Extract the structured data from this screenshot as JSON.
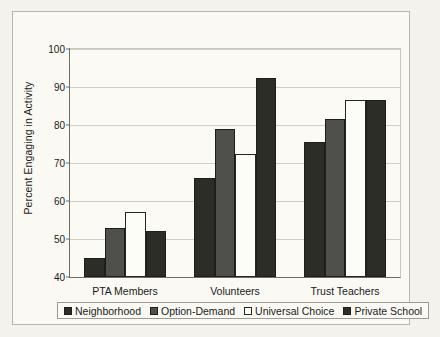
{
  "chart_data": {
    "type": "bar",
    "title": "",
    "xlabel": "",
    "ylabel": "Percent Engaging in Activity",
    "ylim": [
      40,
      100
    ],
    "yticks": [
      40,
      50,
      60,
      70,
      80,
      90,
      100
    ],
    "grid": true,
    "legend_position": "bottom",
    "categories": [
      "PTA Members",
      "Volunteers",
      "Trust Teachers"
    ],
    "series": [
      {
        "name": "Neighborhood",
        "color": "#2d2d28",
        "values": [
          45,
          66,
          75.5
        ]
      },
      {
        "name": "Option-Demand",
        "color": "#4f4f4b",
        "values": [
          53,
          79,
          81.5
        ]
      },
      {
        "name": "Universal Choice",
        "color": "#fdfdf8",
        "values": [
          57,
          72.5,
          86.5
        ]
      },
      {
        "name": "Private School",
        "color": "#2d2d28",
        "values": [
          52,
          92.5,
          86.5
        ]
      }
    ]
  },
  "legend": {
    "items": [
      {
        "label": "Neighborhood",
        "swatch": "dark"
      },
      {
        "label": "Option-Demand",
        "swatch": "gray"
      },
      {
        "label": "Universal Choice",
        "swatch": "white"
      },
      {
        "label": "Private School",
        "swatch": "dark"
      }
    ]
  },
  "colors": {
    "figure_background": "#f4f2ec",
    "plot_background": "#fbfaf5",
    "axis": "#6f6d66",
    "gridline": "#cfcdc4",
    "text": "#1b1b18"
  }
}
